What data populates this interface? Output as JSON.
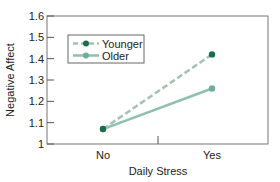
{
  "chart_data": {
    "type": "line",
    "title": "",
    "xlabel": "Daily Stress",
    "ylabel": "Negative Affect",
    "categories": [
      "No",
      "Yes"
    ],
    "series": [
      {
        "name": "Younger",
        "values": [
          1.07,
          1.42
        ],
        "style": "dashed",
        "marker": "circle",
        "color": "#a3c2b4",
        "marker_color": "#1a6e4e"
      },
      {
        "name": "Older",
        "values": [
          1.07,
          1.26
        ],
        "style": "solid",
        "marker": "circle",
        "color": "#8fbfae",
        "marker_color": "#6fae98"
      }
    ],
    "ylim": [
      1,
      1.6
    ],
    "yticks": [
      "1",
      "1.1",
      "1.2",
      "1.3",
      "1.4",
      "1.5",
      "1.6"
    ],
    "grid": false,
    "legend_position": "upper-left"
  },
  "colors": {
    "axis": "#555555",
    "younger_line": "#a3c2b4",
    "younger_marker": "#1a6e4e",
    "older_line": "#8fbfae",
    "older_marker": "#6fae98"
  }
}
